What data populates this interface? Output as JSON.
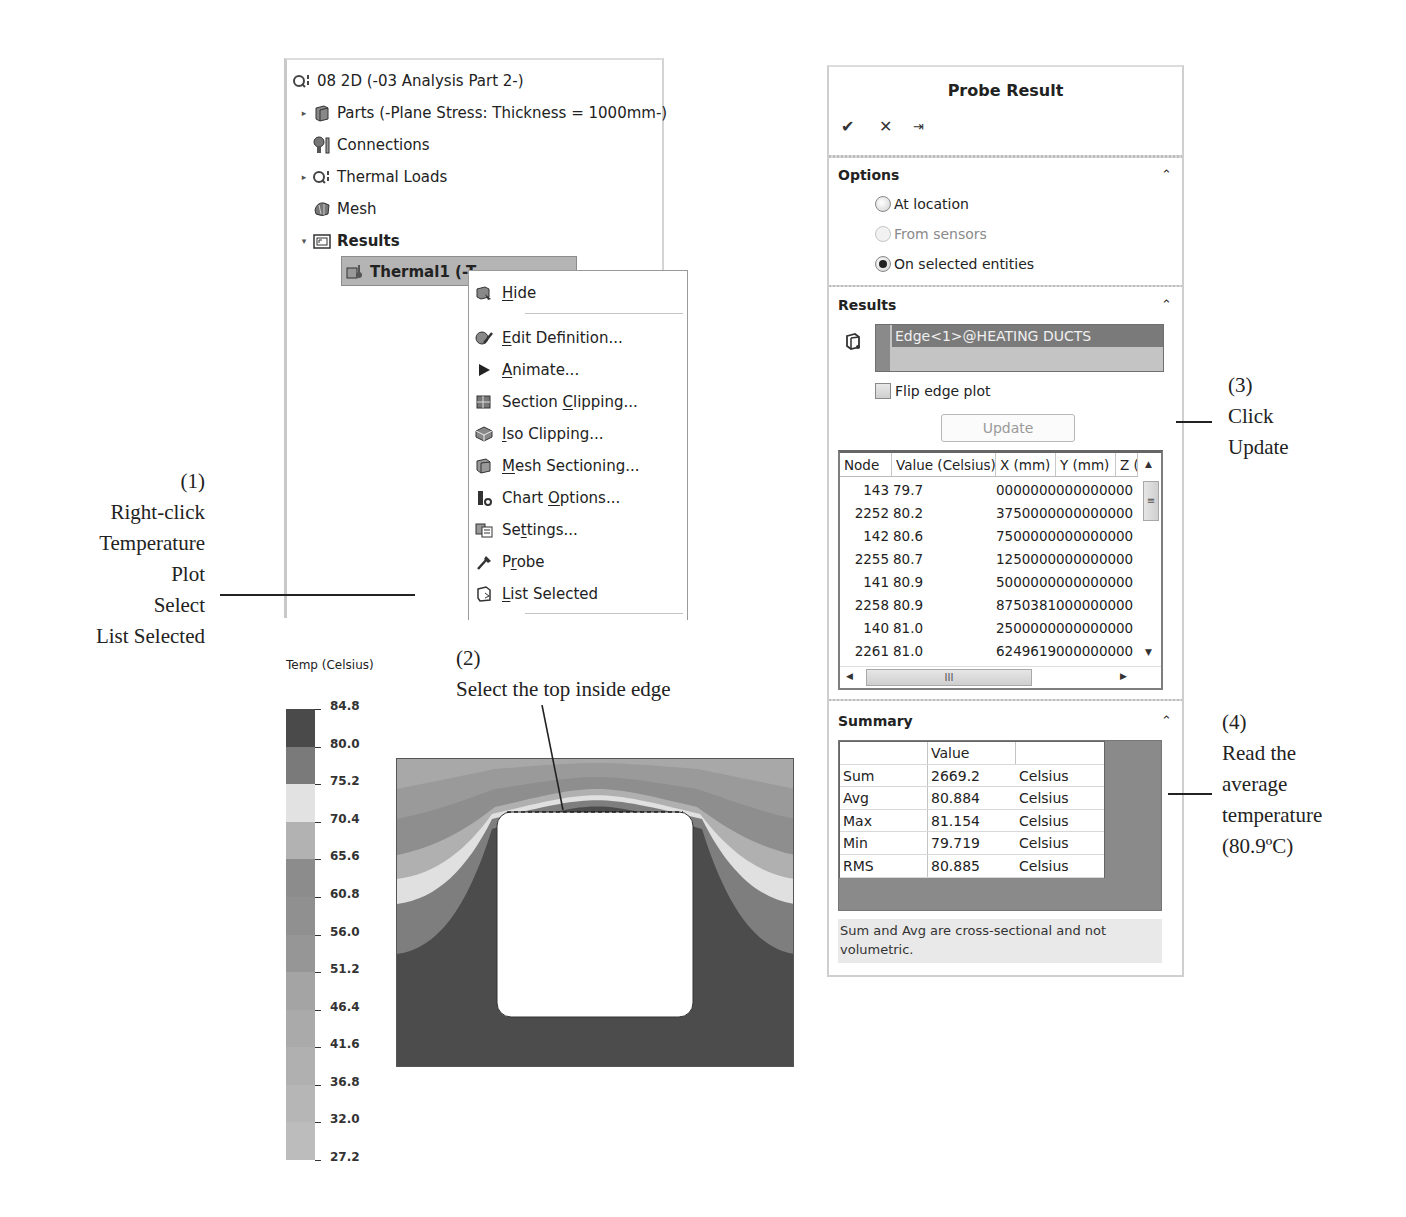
{
  "feature_tree": {
    "root": {
      "label": "08 2D (-03 Analysis Part 2-)",
      "icon": "study-icon"
    },
    "items": [
      {
        "label": "Parts (-Plane Stress: Thickness = 1000mm-)",
        "icon": "parts-icon",
        "expander": "collapsed"
      },
      {
        "label": "Connections",
        "icon": "connections-icon",
        "expander": "none"
      },
      {
        "label": "Thermal Loads",
        "icon": "thermal-loads-icon",
        "expander": "collapsed"
      },
      {
        "label": "Mesh",
        "icon": "mesh-icon",
        "expander": "none"
      },
      {
        "label": "Results",
        "icon": "results-folder-icon",
        "expander": "expanded",
        "bold": true
      }
    ],
    "selected_result": {
      "label": "Thermal1 (-Temperature-)",
      "visible_label": "Thermal1 (-T",
      "icon": "thermal-result-icon"
    }
  },
  "context_menu": {
    "items": [
      {
        "label": "Hide",
        "mnemonic": "H",
        "icon": "hide-icon"
      },
      {
        "label": "Edit Definition...",
        "mnemonic": "E",
        "icon": "edit-definition-icon"
      },
      {
        "label": "Animate...",
        "mnemonic": "A",
        "icon": "animate-icon"
      },
      {
        "label": "Section Clipping...",
        "mnemonic": "C",
        "icon": "section-clipping-icon"
      },
      {
        "label": "Iso Clipping...",
        "mnemonic": "I",
        "icon": "iso-clipping-icon"
      },
      {
        "label": "Mesh Sectioning...",
        "mnemonic": "M",
        "icon": "mesh-sectioning-icon"
      },
      {
        "label": "Chart Options...",
        "mnemonic": "O",
        "icon": "chart-options-icon"
      },
      {
        "label": "Settings...",
        "mnemonic": "t",
        "icon": "settings-icon"
      },
      {
        "label": "Probe",
        "mnemonic": "r",
        "icon": "probe-icon"
      },
      {
        "label": "List Selected",
        "mnemonic": "L",
        "icon": "list-selected-icon"
      }
    ]
  },
  "probe_panel": {
    "title": "Probe Result",
    "toolbar": {
      "ok": "✔",
      "cancel": "✕",
      "pin": "⇥"
    },
    "options": {
      "heading": "Options",
      "radios": [
        {
          "label": "At location",
          "checked": false,
          "enabled": true
        },
        {
          "label": "From sensors",
          "checked": false,
          "enabled": false
        },
        {
          "label": "On selected entities",
          "checked": true,
          "enabled": true
        }
      ]
    },
    "results": {
      "heading": "Results",
      "selected_entity": "Edge<1>@HEATING DUCTS",
      "flip_edge_plot": {
        "label": "Flip edge plot",
        "checked": false
      },
      "update_label": "Update",
      "table": {
        "columns": [
          "Node",
          "Value (Celsius)",
          "X (mm)",
          "Y (mm)",
          "Z ("
        ],
        "rows": [
          {
            "node": "143",
            "value": "79.7",
            "x": "0000000",
            "y": "0000000",
            "z": "00"
          },
          {
            "node": "2252",
            "value": "80.2",
            "x": "3750000",
            "y": "0000000",
            "z": "00"
          },
          {
            "node": "142",
            "value": "80.6",
            "x": "7500000",
            "y": "0000000",
            "z": "00"
          },
          {
            "node": "2255",
            "value": "80.7",
            "x": "1250000",
            "y": "0000000",
            "z": "00"
          },
          {
            "node": "141",
            "value": "80.9",
            "x": "5000000",
            "y": "0000000",
            "z": "00"
          },
          {
            "node": "2258",
            "value": "80.9",
            "x": "8750381",
            "y": "0000000",
            "z": "00"
          },
          {
            "node": "140",
            "value": "81.0",
            "x": "2500000",
            "y": "0000000",
            "z": "00"
          },
          {
            "node": "2261",
            "value": "81.0",
            "x": "6249619",
            "y": "0000000",
            "z": "00"
          }
        ]
      }
    },
    "summary": {
      "heading": "Summary",
      "columns": [
        "",
        "Value",
        ""
      ],
      "rows": [
        {
          "label": "Sum",
          "value": "2669.2",
          "unit": "Celsius"
        },
        {
          "label": "Avg",
          "value": "80.884",
          "unit": "Celsius"
        },
        {
          "label": "Max",
          "value": "81.154",
          "unit": "Celsius"
        },
        {
          "label": "Min",
          "value": "79.719",
          "unit": "Celsius"
        },
        {
          "label": "RMS",
          "value": "80.885",
          "unit": "Celsius"
        }
      ],
      "note": "Sum and Avg are cross-sectional and not volumetric."
    }
  },
  "legend": {
    "title": "Temp (Celsius)",
    "ticks": [
      "84.8",
      "80.0",
      "75.2",
      "70.4",
      "65.6",
      "60.8",
      "56.0",
      "51.2",
      "46.4",
      "41.6",
      "36.8",
      "32.0",
      "27.2"
    ],
    "band_colors": [
      "#4a4a4a",
      "#7a7a7a",
      "#e2e2e2",
      "#b2b2b2",
      "#8c8c8c",
      "#909090",
      "#969696",
      "#a4a4a4",
      "#aaaaaa",
      "#b0b0b0",
      "#b6b6b6",
      "#bcbcbc"
    ]
  },
  "annotations": {
    "step1": [
      "(1)",
      "Right-click",
      "Temperature",
      "Plot",
      "Select",
      "List Selected"
    ],
    "step2": [
      "(2)",
      "Select the top inside edge"
    ],
    "step3": [
      "(3)",
      "Click",
      "Update"
    ],
    "step4": [
      "(4)",
      "Read the",
      "average",
      "temperature",
      "(80.9ºC)"
    ]
  }
}
